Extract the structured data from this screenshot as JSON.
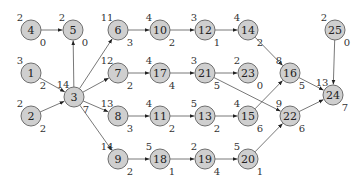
{
  "diagram": {
    "type": "directed-network",
    "nodes": [
      {
        "id": "4",
        "x": 31,
        "y": 30,
        "top": "2",
        "bottom": "0"
      },
      {
        "id": "5",
        "x": 73,
        "y": 30,
        "top": "2",
        "bottom": "0"
      },
      {
        "id": "6",
        "x": 118,
        "y": 30,
        "top": "11",
        "bottom": "3"
      },
      {
        "id": "10",
        "x": 160,
        "y": 30,
        "top": "4",
        "bottom": "2"
      },
      {
        "id": "12",
        "x": 205,
        "y": 30,
        "top": "3",
        "bottom": "1"
      },
      {
        "id": "14",
        "x": 248,
        "y": 30,
        "top": "4",
        "bottom": "2"
      },
      {
        "id": "25",
        "x": 335,
        "y": 30,
        "top": "2",
        "bottom": "0"
      },
      {
        "id": "1",
        "x": 31,
        "y": 73,
        "top": "3",
        "bottom": "2"
      },
      {
        "id": "7",
        "x": 118,
        "y": 73,
        "top": "12",
        "bottom": "2"
      },
      {
        "id": "17",
        "x": 160,
        "y": 73,
        "top": "4",
        "bottom": "4"
      },
      {
        "id": "21",
        "x": 205,
        "y": 73,
        "top": "3",
        "bottom": "5"
      },
      {
        "id": "23",
        "x": 248,
        "y": 73,
        "top": "2",
        "bottom": "0"
      },
      {
        "id": "16",
        "x": 290,
        "y": 73,
        "top": "8",
        "bottom": "5"
      },
      {
        "id": "3",
        "x": 74,
        "y": 97,
        "top": "14",
        "bottom": "7"
      },
      {
        "id": "24",
        "x": 333,
        "y": 95,
        "top": "13",
        "bottom": "7"
      },
      {
        "id": "2",
        "x": 31,
        "y": 116,
        "top": "2",
        "bottom": "2"
      },
      {
        "id": "8",
        "x": 118,
        "y": 116,
        "top": "13",
        "bottom": "3"
      },
      {
        "id": "11",
        "x": 160,
        "y": 116,
        "top": "4",
        "bottom": "2"
      },
      {
        "id": "13",
        "x": 205,
        "y": 116,
        "top": "5",
        "bottom": "2"
      },
      {
        "id": "15",
        "x": 248,
        "y": 116,
        "top": "4",
        "bottom": "6"
      },
      {
        "id": "22",
        "x": 290,
        "y": 116,
        "top": "9",
        "bottom": "6"
      },
      {
        "id": "9",
        "x": 118,
        "y": 159,
        "top": "14",
        "bottom": "2"
      },
      {
        "id": "18",
        "x": 160,
        "y": 159,
        "top": "5",
        "bottom": "1"
      },
      {
        "id": "19",
        "x": 205,
        "y": 159,
        "top": "2",
        "bottom": "4"
      },
      {
        "id": "20",
        "x": 248,
        "y": 159,
        "top": "5",
        "bottom": "1"
      }
    ],
    "edges": [
      [
        "4",
        "5"
      ],
      [
        "3",
        "5"
      ],
      [
        "1",
        "3"
      ],
      [
        "2",
        "3"
      ],
      [
        "3",
        "6"
      ],
      [
        "3",
        "7"
      ],
      [
        "3",
        "8"
      ],
      [
        "3",
        "9"
      ],
      [
        "6",
        "10"
      ],
      [
        "10",
        "12"
      ],
      [
        "12",
        "14"
      ],
      [
        "14",
        "16"
      ],
      [
        "7",
        "17"
      ],
      [
        "17",
        "21"
      ],
      [
        "21",
        "23"
      ],
      [
        "21",
        "22"
      ],
      [
        "8",
        "11"
      ],
      [
        "11",
        "13"
      ],
      [
        "13",
        "15"
      ],
      [
        "15",
        "16"
      ],
      [
        "9",
        "18"
      ],
      [
        "18",
        "19"
      ],
      [
        "19",
        "20"
      ],
      [
        "20",
        "22"
      ],
      [
        "16",
        "24"
      ],
      [
        "22",
        "24"
      ],
      [
        "25",
        "24"
      ]
    ]
  }
}
